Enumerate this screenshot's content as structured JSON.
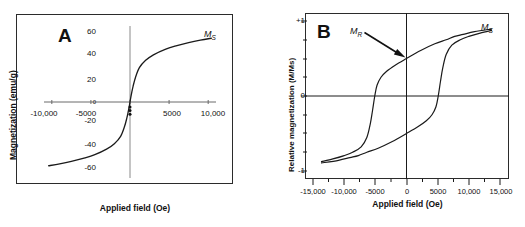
{
  "figure": {
    "background": "#ffffff",
    "line_color": "#1a1a1a",
    "axis_color": "#555555",
    "frame_color": "#2b2b2b"
  },
  "panel_a": {
    "letter": "A",
    "axis_x_title": "Applied field (Oe)",
    "axis_y_title": "Magnetization (emu/g)",
    "annotation_ms": "M",
    "annotation_ms_sub": "S",
    "x_ticks": [
      "-10,000",
      "-5000",
      "5000",
      "10,000"
    ],
    "y_ticks": [
      "60",
      "40",
      "20",
      "0",
      "-20",
      "-40",
      "-60"
    ]
  },
  "panel_b": {
    "letter": "B",
    "axis_x_title": "Applied field (Oe)",
    "axis_y_title": "Relative magnetization (M/Ms)",
    "annotation_mr": "M",
    "annotation_mr_sub": "R",
    "annotation_ms": "M",
    "annotation_ms_sub": "S",
    "x_ticks": [
      "-15,000",
      "-10,000",
      "-5000",
      "0",
      "5000",
      "10,000",
      "15,000"
    ],
    "y_ticks": [
      "+1",
      "0",
      "-1"
    ]
  },
  "chart_data": [
    {
      "type": "line",
      "panel": "A",
      "title": "A",
      "xlabel": "Applied field (Oe)",
      "ylabel": "Magnetization (emu/g)",
      "xlim": [
        -11000,
        11000
      ],
      "ylim": [
        -62,
        62
      ],
      "xticks": [
        -10000,
        -5000,
        0,
        5000,
        10000
      ],
      "xticklabels": [
        "-10,000",
        "-5000",
        "0",
        "5000",
        "10,000"
      ],
      "yticks": [
        -60,
        -40,
        -20,
        0,
        20,
        40,
        60
      ],
      "yticklabels": [
        "-60",
        "-40",
        "-20",
        "0",
        "20",
        "40",
        "60"
      ],
      "grid": false,
      "legend": "none",
      "annotations": [
        {
          "text": "Ms",
          "x": 9600,
          "y": 54,
          "note": "saturation magnetization label at curve end"
        }
      ],
      "series": [
        {
          "name": "superparamagnetic magnetization curve",
          "x": [
            -10400,
            -9000,
            -7500,
            -6000,
            -4500,
            -3000,
            -2000,
            -1200,
            -700,
            -400,
            -200,
            -80,
            0,
            80,
            200,
            400,
            700,
            1200,
            2000,
            3000,
            4500,
            6000,
            7500,
            9000,
            10400
          ],
          "y": [
            -52,
            -50.5,
            -48.5,
            -46,
            -43,
            -38.5,
            -34,
            -28,
            -20,
            -13,
            -7,
            -3,
            0,
            3,
            7,
            13,
            20,
            28,
            34,
            38.5,
            43,
            46,
            48.5,
            50.5,
            52
          ]
        }
      ]
    },
    {
      "type": "line",
      "panel": "B",
      "title": "B",
      "xlabel": "Applied field (Oe)",
      "ylabel": "Relative magnetization (M/Ms)",
      "xlim": [
        -16500,
        16500
      ],
      "ylim": [
        -1.12,
        1.12
      ],
      "xticks": [
        -15000,
        -10000,
        -5000,
        0,
        5000,
        10000,
        15000
      ],
      "xticklabels": [
        "-15,000",
        "-10,000",
        "-5000",
        "0",
        "5000",
        "10,000",
        "15,000"
      ],
      "yticks": [
        -1,
        0,
        1
      ],
      "yticklabels": [
        "-1",
        "0",
        "+1"
      ],
      "grid": false,
      "legend": "none",
      "annotations": [
        {
          "text": "MR",
          "x": -4200,
          "y": 0.92,
          "note": "remanent magnetization, arrow points to y-intercept of upper branch at M/Ms = 0.56"
        },
        {
          "text": "Ms",
          "x": 14600,
          "y": 0.99,
          "note": "saturation magnetization label at curve end"
        }
      ],
      "coercivity_Oe": 5600,
      "remanence_rel": 0.56,
      "series": [
        {
          "name": "upper branch (field decreasing)",
          "x": [
            15000,
            12000,
            10000,
            8500,
            7000,
            5000,
            2500,
            0,
            -2000,
            -3500,
            -4500,
            -5200,
            -5600,
            -6000,
            -6400,
            -7000,
            -8000,
            -9500,
            -11000,
            -13000,
            -15000
          ],
          "y": [
            1.0,
            0.96,
            0.92,
            0.89,
            0.84,
            0.78,
            0.68,
            0.56,
            0.46,
            0.37,
            0.28,
            0.16,
            0.0,
            -0.22,
            -0.42,
            -0.62,
            -0.76,
            -0.84,
            -0.89,
            -0.94,
            -0.98
          ]
        },
        {
          "name": "lower branch (field increasing)",
          "x": [
            -15000,
            -12000,
            -10000,
            -8500,
            -7000,
            -5000,
            -2500,
            0,
            2000,
            3500,
            4500,
            5200,
            5600,
            6000,
            6400,
            7000,
            8000,
            9500,
            11000,
            13000,
            15000
          ],
          "y": [
            -1.0,
            -0.96,
            -0.92,
            -0.89,
            -0.84,
            -0.78,
            -0.68,
            -0.56,
            -0.46,
            -0.37,
            -0.28,
            -0.16,
            0.0,
            0.22,
            0.42,
            0.62,
            0.76,
            0.84,
            0.89,
            0.94,
            0.98
          ]
        }
      ]
    }
  ]
}
